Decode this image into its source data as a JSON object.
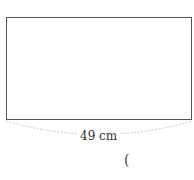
{
  "diagram": {
    "shape": "rectangle",
    "width_label": "49 cm",
    "answer_paren": "(",
    "colors": {
      "stroke": "#555555",
      "brace": "#c8c8c8",
      "text": "#333333"
    }
  }
}
